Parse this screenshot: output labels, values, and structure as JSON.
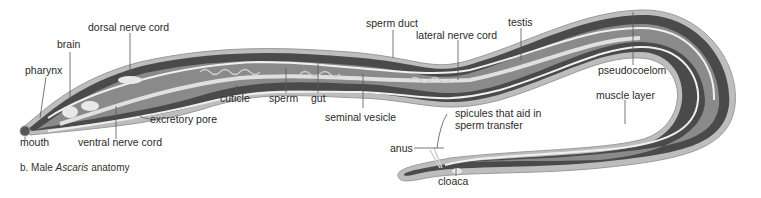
{
  "figure": {
    "caption_prefix": "b. Male ",
    "caption_species": "Ascaris",
    "caption_suffix": " anatomy"
  },
  "colors": {
    "cuticle": "#bdbdbd",
    "muscle": "#4a4a4a",
    "muscle_dark": "#353535",
    "pseudocoelom": "#8a8a8a",
    "organs": "#e8e8e8",
    "label_text": "#2a2a2a",
    "leader": "#555555"
  },
  "labels": {
    "dorsal_nerve_cord": "dorsal nerve cord",
    "brain": "brain",
    "pharynx": "pharynx",
    "mouth": "mouth",
    "ventral_nerve_cord": "ventral nerve cord",
    "excretory_pore": "excretory pore",
    "cuticle": "cuticle",
    "sperm": "sperm",
    "gut": "gut",
    "seminal_vesicle": "seminal vesicle",
    "sperm_duct": "sperm duct",
    "lateral_nerve_cord": "lateral nerve cord",
    "testis": "testis",
    "pseudocoelom": "pseudocoelom",
    "muscle_layer": "muscle layer",
    "spicules_line1": "spicules that aid in",
    "spicules_line2": "sperm transfer",
    "anus": "anus",
    "cloaca": "cloaca"
  }
}
